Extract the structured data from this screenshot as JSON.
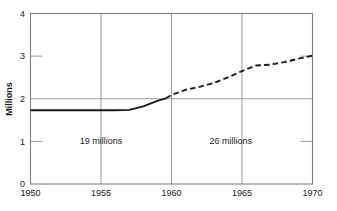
{
  "chart_data": {
    "type": "line",
    "title": "",
    "subtitle": "",
    "xlabel": "",
    "ylabel": "Millions",
    "xlim": [
      1950,
      1970
    ],
    "ylim": [
      0,
      4
    ],
    "grid": true,
    "legend": "none",
    "x_ticks": [
      "1950",
      "1955",
      "1960",
      "1965",
      "1970"
    ],
    "x_tick_values": [
      1950,
      1955,
      1960,
      1965,
      1970
    ],
    "y_ticks": [
      "0",
      "1",
      "2",
      "3",
      "4"
    ],
    "y_tick_values": [
      0,
      1,
      2,
      3,
      4
    ],
    "gridlines": {
      "horizontal_full": [
        2
      ],
      "horizontal_stub": [
        1,
        3
      ],
      "vertical_full": [
        1955,
        1960,
        1965
      ]
    },
    "series": [
      {
        "name": "observed",
        "style": "solid",
        "x": [
          1950,
          1951,
          1952,
          1953,
          1954,
          1955,
          1956,
          1957,
          1958,
          1959,
          1959.6
        ],
        "values": [
          1.73,
          1.73,
          1.73,
          1.73,
          1.73,
          1.73,
          1.73,
          1.74,
          1.82,
          1.95,
          2.01
        ]
      },
      {
        "name": "projected",
        "style": "dashed",
        "x": [
          1959.6,
          1960,
          1961,
          1962,
          1963,
          1964,
          1965,
          1966,
          1967,
          1968,
          1969,
          1970
        ],
        "values": [
          2.01,
          2.09,
          2.21,
          2.28,
          2.37,
          2.5,
          2.65,
          2.78,
          2.8,
          2.86,
          2.94,
          3.01
        ]
      }
    ],
    "annotations": [
      {
        "id": "left-note",
        "text": "19 millions",
        "x": 1955.0,
        "y": 1.02
      },
      {
        "id": "right-note",
        "text": "26 millions",
        "x": 1964.2,
        "y": 1.02
      }
    ]
  },
  "colors": {
    "line": "#1a1a1a",
    "frame": "#808080",
    "grid": "#9a9a9a",
    "background": "#ffffff",
    "text": "#1a1a1a"
  }
}
